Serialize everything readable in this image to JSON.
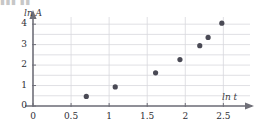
{
  "top_fragment": {
    "text": "▮▮▮ ▮▮"
  },
  "chart_data": {
    "type": "scatter",
    "title": "",
    "xlabel": "ln t",
    "ylabel": "ln A",
    "xlim": [
      0,
      2.85
    ],
    "ylim": [
      0,
      4.35
    ],
    "xticks": [
      "0",
      "0.5",
      "1",
      "1.5",
      "2",
      "2.5"
    ],
    "xtick_values": [
      0,
      0.5,
      1,
      1.5,
      2,
      2.5
    ],
    "yticks": [
      "0",
      "1",
      "2",
      "3",
      "4"
    ],
    "ytick_values": [
      0,
      1,
      2,
      3,
      4
    ],
    "grid": true,
    "grid_x_step": 0.5,
    "grid_y_step": 0.5,
    "legend": "none",
    "marker_color": "#4a4a55",
    "grid_color": "#d8d8dd",
    "axis_color": "#6f6f78",
    "points": [
      {
        "x": 0.7,
        "y": 0.47
      },
      {
        "x": 1.08,
        "y": 0.93
      },
      {
        "x": 1.61,
        "y": 1.62
      },
      {
        "x": 1.93,
        "y": 2.27
      },
      {
        "x": 2.19,
        "y": 2.95
      },
      {
        "x": 2.3,
        "y": 3.35
      },
      {
        "x": 2.48,
        "y": 4.05
      }
    ]
  }
}
